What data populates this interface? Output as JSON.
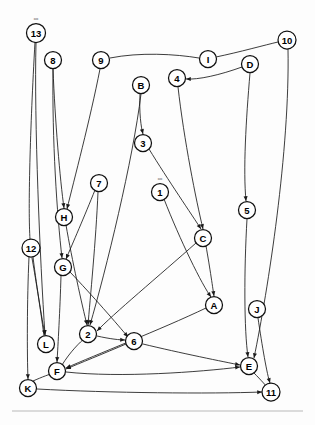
{
  "figure": {
    "background_color": "#fdfdfd",
    "line_color": "#1a1a1a",
    "node_fill_color": "#ffffff",
    "node_stroke_color": "#111111",
    "width": 315,
    "height": 425
  },
  "nodes": [
    {
      "id": "13",
      "label": "13",
      "x": 36,
      "y": 33,
      "r": 9.5,
      "tag": "ooo"
    },
    {
      "id": "8",
      "label": "8",
      "x": 53,
      "y": 60,
      "r": 8.5,
      "tag": ""
    },
    {
      "id": "9",
      "label": "9",
      "x": 101,
      "y": 60,
      "r": 8.5,
      "tag": ""
    },
    {
      "id": "B",
      "label": "B",
      "x": 141,
      "y": 85,
      "r": 8.5,
      "tag": ""
    },
    {
      "id": "4",
      "label": "4",
      "x": 177,
      "y": 78,
      "r": 8.5,
      "tag": ""
    },
    {
      "id": "I",
      "label": "I",
      "x": 208,
      "y": 59,
      "r": 8.5,
      "tag": ""
    },
    {
      "id": "D",
      "label": "D",
      "x": 250,
      "y": 64,
      "r": 8.5,
      "tag": ""
    },
    {
      "id": "10",
      "label": "10",
      "x": 287,
      "y": 40,
      "r": 9.0,
      "tag": ""
    },
    {
      "id": "3",
      "label": "3",
      "x": 143,
      "y": 143,
      "r": 8.5,
      "tag": ""
    },
    {
      "id": "7",
      "label": "7",
      "x": 99,
      "y": 183,
      "r": 8.5,
      "tag": ""
    },
    {
      "id": "1",
      "label": "1",
      "x": 160,
      "y": 192,
      "r": 8.5,
      "tag": "ooo"
    },
    {
      "id": "H",
      "label": "H",
      "x": 64,
      "y": 217,
      "r": 8.5,
      "tag": ""
    },
    {
      "id": "5",
      "label": "5",
      "x": 247,
      "y": 210,
      "r": 8.5,
      "tag": ""
    },
    {
      "id": "C",
      "label": "C",
      "x": 203,
      "y": 238,
      "r": 8.5,
      "tag": ""
    },
    {
      "id": "12",
      "label": "12",
      "x": 31,
      "y": 248,
      "r": 9.0,
      "tag": ""
    },
    {
      "id": "G",
      "label": "G",
      "x": 63,
      "y": 267,
      "r": 8.5,
      "tag": ""
    },
    {
      "id": "A",
      "label": "A",
      "x": 214,
      "y": 305,
      "r": 8.5,
      "tag": ""
    },
    {
      "id": "J",
      "label": "J",
      "x": 257,
      "y": 309,
      "r": 8.5,
      "tag": ""
    },
    {
      "id": "L",
      "label": "L",
      "x": 46,
      "y": 344,
      "r": 8.5,
      "tag": ""
    },
    {
      "id": "2",
      "label": "2",
      "x": 88,
      "y": 334,
      "r": 8.5,
      "tag": ""
    },
    {
      "id": "6",
      "label": "6",
      "x": 134,
      "y": 341,
      "r": 8.5,
      "tag": ""
    },
    {
      "id": "E",
      "label": "E",
      "x": 249,
      "y": 366,
      "r": 8.5,
      "tag": ""
    },
    {
      "id": "F",
      "label": "F",
      "x": 57,
      "y": 371,
      "r": 8.5,
      "tag": ""
    },
    {
      "id": "K",
      "label": "K",
      "x": 28,
      "y": 388,
      "r": 8.5,
      "tag": ""
    },
    {
      "id": "11",
      "label": "11",
      "x": 271,
      "y": 392,
      "r": 9.0,
      "tag": ""
    }
  ],
  "edges": [
    {
      "from": "13",
      "to": "L",
      "path": "M 36 43 C 34 120, 40 260, 45 335",
      "arrow": true
    },
    {
      "from": "8",
      "to": "H",
      "path": "M 53 69 C 55 120, 60 180, 64 208",
      "arrow": true
    },
    {
      "from": "8",
      "to": "G",
      "path": "M 53 69 C 52 140, 57 215, 62 258",
      "arrow": true
    },
    {
      "from": "9",
      "to": "H",
      "path": "M 100 69 C 90 120, 74 180, 67 209",
      "arrow": true
    },
    {
      "from": "9",
      "to": "I",
      "path": "M 110 58 C 140 52, 175 54, 199 58",
      "arrow": false
    },
    {
      "from": "I",
      "to": "10",
      "path": "M 216 57 C 240 52, 265 45, 278 42",
      "arrow": false
    },
    {
      "from": "D",
      "to": "4",
      "path": "M 242 67 C 220 75, 198 80, 186 79",
      "arrow": true
    },
    {
      "from": "D",
      "to": "5",
      "path": "M 250 73 C 246 120, 243 170, 246 201",
      "arrow": true
    },
    {
      "from": "10",
      "to": "E",
      "path": "M 288 49 C 290 150, 268 290, 254 358",
      "arrow": true
    },
    {
      "from": "4",
      "to": "C",
      "path": "M 178 87 C 184 140, 196 200, 203 229",
      "arrow": true
    },
    {
      "from": "B",
      "to": "3",
      "path": "M 140 94 C 139 112, 141 128, 143 134",
      "arrow": true
    },
    {
      "from": "B",
      "to": "2",
      "path": "M 141 94 C 133 160, 106 270, 90 325",
      "arrow": true
    },
    {
      "from": "3",
      "to": "C",
      "path": "M 149 149 C 168 180, 192 215, 201 229",
      "arrow": true
    },
    {
      "from": "1",
      "to": "A",
      "path": "M 164 199 C 180 240, 202 285, 211 297",
      "arrow": true
    },
    {
      "from": "7",
      "to": "G",
      "path": "M 95 190 C 85 215, 72 245, 66 259",
      "arrow": true
    },
    {
      "from": "7",
      "to": "2",
      "path": "M 98 192 C 96 240, 90 300, 88 325",
      "arrow": true
    },
    {
      "from": "H",
      "to": "2",
      "path": "M 66 225 C 72 260, 82 305, 87 325",
      "arrow": true
    },
    {
      "from": "G",
      "to": "6",
      "path": "M 70 272 C 92 295, 118 325, 128 337",
      "arrow": true
    },
    {
      "from": "G",
      "to": "F",
      "path": "M 61 276 C 60 310, 58 345, 57 362",
      "arrow": true
    },
    {
      "from": "12",
      "to": "L",
      "path": "M 33 257 C 37 290, 43 325, 45 335",
      "arrow": true
    },
    {
      "from": "12",
      "to": "K",
      "path": "M 29 257 C 27 300, 27 355, 28 379",
      "arrow": true
    },
    {
      "from": "C",
      "to": "2",
      "path": "M 196 243 C 160 275, 112 315, 97 331",
      "arrow": true
    },
    {
      "from": "C",
      "to": "A",
      "path": "M 206 246 C 210 268, 213 290, 214 296",
      "arrow": true
    },
    {
      "from": "5",
      "to": "E",
      "path": "M 247 219 C 244 270, 244 330, 248 357",
      "arrow": true
    },
    {
      "from": "J",
      "to": "11",
      "path": "M 258 318 C 262 345, 267 375, 270 383",
      "arrow": true
    },
    {
      "from": "A",
      "to": "F",
      "path": "M 206 308 C 160 330, 95 355, 66 368",
      "arrow": true
    },
    {
      "from": "2",
      "to": "6",
      "path": "M 97 336 C 110 339, 120 340, 125 340",
      "arrow": true
    },
    {
      "from": "6",
      "to": "F",
      "path": "M 126 344 C 105 353, 78 364, 66 369",
      "arrow": true
    },
    {
      "from": "6",
      "to": "E",
      "path": "M 143 344 C 180 353, 225 362, 240 365",
      "arrow": true
    },
    {
      "from": "F",
      "to": "E",
      "path": "M 66 372 C 120 378, 200 372, 240 367",
      "arrow": true
    },
    {
      "from": "F",
      "to": "2",
      "path": "M 62 365 C 70 352, 80 342, 85 338",
      "arrow": false
    },
    {
      "from": "K",
      "to": "11",
      "path": "M 37 389 C 110 393, 210 394, 262 392",
      "arrow": true
    },
    {
      "from": "K",
      "to": "F",
      "path": "M 33 381 C 42 377, 50 374, 54 373",
      "arrow": false
    },
    {
      "from": "L",
      "to": "12",
      "path": "M 44 336 C 40 305, 35 275, 32 258",
      "arrow": false
    },
    {
      "from": "E",
      "to": "11",
      "path": "M 254 373 C 261 380, 267 387, 269 389",
      "arrow": false
    },
    {
      "from": "13",
      "to": "12",
      "path": "M 35 42 C 30 130, 28 210, 30 239",
      "arrow": false
    }
  ],
  "footer": {
    "rule_color": "#b9b9b9",
    "rule_y": 411
  }
}
